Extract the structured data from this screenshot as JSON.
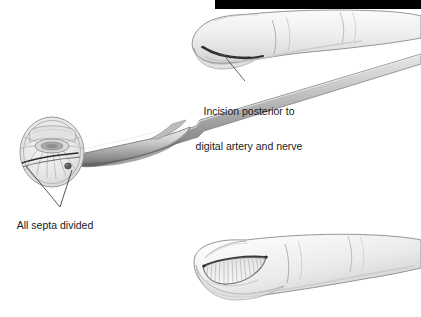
{
  "figure": {
    "type": "medical-illustration",
    "background_color": "#ffffff",
    "ink_color": "#1a1a1a",
    "skin_fill": "#eeeeee",
    "skin_shadow": "#d9d9d9",
    "outline_color": "#7d7d7d",
    "incision_color": "#3a3a3a",
    "blade_light": "#d6d6d6",
    "blade_dark": "#6e6e6e",
    "top_bar_color": "#000000"
  },
  "labels": {
    "incision": {
      "name": "incision-label",
      "line1": "Incision posterior to",
      "line2": "digital artery and nerve"
    },
    "septa": {
      "name": "septa-label",
      "line1": "All septa divided"
    }
  },
  "panels": {
    "top_finger": {
      "name": "lateral-finger-with-incision",
      "description": "Lateral view of finger showing curved incision on pulp"
    },
    "cross_section": {
      "name": "fingertip-cross-section-with-scalpel",
      "description": "Cross-section of distal fingertip pulp with scalpel dividing septa"
    },
    "bottom_finger": {
      "name": "lateral-finger-with-open-wound",
      "description": "Lateral view of finger with incision opened showing divided septa"
    }
  }
}
